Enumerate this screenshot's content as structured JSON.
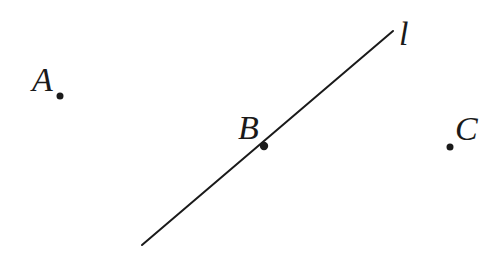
{
  "figure": {
    "type": "geometry-diagram",
    "background_color": "#ffffff",
    "ink_color": "#1a1a1a",
    "width": 500,
    "height": 253
  },
  "labels": {
    "point_a": "A",
    "point_b": "B",
    "point_c": "C",
    "line_l": "l"
  },
  "chart_data": {
    "type": "scatter",
    "title": "",
    "xlabel": "",
    "ylabel": "",
    "grid": false,
    "legend": null,
    "xlim": [
      0,
      500
    ],
    "ylim": [
      253,
      0
    ],
    "points": [
      {
        "name": "A",
        "x": 60,
        "y": 96,
        "label": "A",
        "label_position": "left",
        "on_line": false,
        "radius": 3.5
      },
      {
        "name": "B",
        "x": 264,
        "y": 146,
        "label": "B",
        "label_position": "upper-left",
        "on_line": true,
        "radius": 4.2
      },
      {
        "name": "C",
        "x": 450,
        "y": 147,
        "label": "C",
        "label_position": "right",
        "on_line": false,
        "radius": 3.5
      }
    ],
    "lines": [
      {
        "name": "l",
        "label": "l",
        "x1": 142,
        "y1": 245,
        "x2": 393,
        "y2": 31,
        "stroke_width": 2,
        "label_x": 406,
        "label_y": 36
      }
    ],
    "annotations": [
      "Line l passes through point B",
      "Points A and C are not on line l"
    ]
  }
}
